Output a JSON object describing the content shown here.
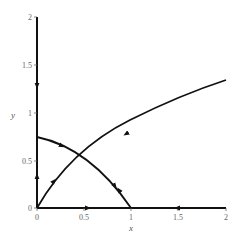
{
  "figure": {
    "type": "phase-portrait",
    "xlabel": "x",
    "ylabel": "y",
    "x_ticks": [
      "0",
      "0.5",
      "1",
      "1.5",
      "2"
    ],
    "y_ticks": [
      "0",
      "0.5",
      "1",
      "1.5",
      "2"
    ],
    "xlim": [
      0,
      2
    ],
    "ylim": [
      0,
      2
    ],
    "line_color": "#111111",
    "fixed_points": [
      [
        0,
        0
      ],
      [
        1,
        0
      ],
      [
        0,
        0.75
      ],
      [
        0.5,
        0.5
      ]
    ],
    "trajectories": [
      {
        "name": "y-axis-upper",
        "from": [
          0,
          2
        ],
        "to": [
          0,
          0.75
        ],
        "direction": "down"
      },
      {
        "name": "y-axis-lower",
        "from": [
          0,
          0
        ],
        "to": [
          0,
          0.75
        ],
        "direction": "up"
      },
      {
        "name": "x-axis-left",
        "from": [
          0,
          0
        ],
        "to": [
          1,
          0
        ],
        "direction": "right"
      },
      {
        "name": "x-axis-right",
        "from": [
          2,
          0
        ],
        "to": [
          1,
          0
        ],
        "direction": "left"
      },
      {
        "name": "stable-manifold-lower",
        "from": [
          0,
          0
        ],
        "to": [
          0.5,
          0.5
        ],
        "direction": "toward-saddle"
      },
      {
        "name": "stable-manifold-upper",
        "from": [
          2,
          1.34
        ],
        "to": [
          0.5,
          0.5
        ],
        "direction": "toward-saddle"
      },
      {
        "name": "unstable-manifold-left",
        "from": [
          0.5,
          0.5
        ],
        "to": [
          0,
          0.75
        ],
        "direction": "away-from-saddle"
      },
      {
        "name": "unstable-manifold-right",
        "from": [
          0.5,
          0.5
        ],
        "to": [
          1,
          0
        ],
        "direction": "away-from-saddle"
      }
    ]
  }
}
